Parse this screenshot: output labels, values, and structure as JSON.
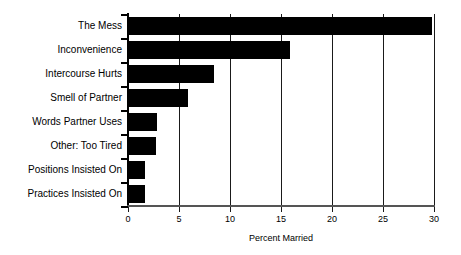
{
  "chart_data": {
    "type": "bar",
    "orientation": "horizontal",
    "title": "",
    "subtitle": "",
    "xlabel": "Percent Married",
    "ylabel": "",
    "categories": [
      "The Mess",
      "Inconvenience",
      "Intercourse Hurts",
      "Smell of Partner",
      "Words Partner Uses",
      "Other: Too Tired",
      "Positions Insisted On",
      "Practices Insisted On"
    ],
    "values": [
      29.8,
      15.9,
      8.4,
      5.9,
      2.8,
      2.7,
      1.7,
      1.7
    ],
    "xlim": [
      0,
      30
    ],
    "xticks": [
      0,
      5,
      10,
      15,
      20,
      25,
      30
    ],
    "xtick_labels": [
      "0",
      "5",
      "10",
      "15",
      "20",
      "25",
      "30"
    ],
    "grid": "vertical",
    "legend": "none",
    "bar_color": "#000000",
    "background_color": "#ffffff",
    "axis_color": "#000000"
  }
}
